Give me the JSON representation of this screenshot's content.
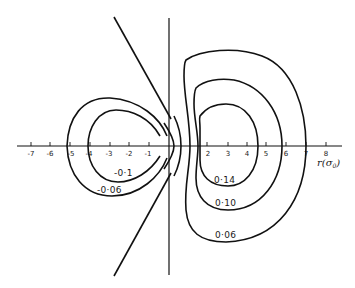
{
  "figure": {
    "axis": {
      "label": "r (σ₀)",
      "label_main": "r",
      "label_unit": "(σ",
      "label_sub": "0",
      "label_close": ")",
      "ticks": [
        {
          "value": -7,
          "label": "-7"
        },
        {
          "value": -6,
          "label": "-6"
        },
        {
          "value": -5,
          "label": "-5"
        },
        {
          "value": -4,
          "label": "-4"
        },
        {
          "value": -3,
          "label": "-3"
        },
        {
          "value": -2,
          "label": "-2"
        },
        {
          "value": -1,
          "label": "-1"
        },
        {
          "value": 2,
          "label": "2"
        },
        {
          "value": 3,
          "label": "3"
        },
        {
          "value": 4,
          "label": "4"
        },
        {
          "value": 5,
          "label": "5"
        },
        {
          "value": 6,
          "label": "6"
        },
        {
          "value": 7,
          "label": "7"
        },
        {
          "value": 8,
          "label": "8"
        }
      ]
    },
    "contours": {
      "negative": [
        {
          "value": -0.1,
          "label": "-0·1"
        },
        {
          "value": -0.06,
          "label": "-0·06"
        }
      ],
      "positive": [
        {
          "value": 0.14,
          "label": "0·14"
        },
        {
          "value": 0.1,
          "label": "0·10"
        },
        {
          "value": 0.06,
          "label": "0·06"
        }
      ]
    },
    "colors": {
      "line": "#111111",
      "background": "#ffffff"
    }
  }
}
